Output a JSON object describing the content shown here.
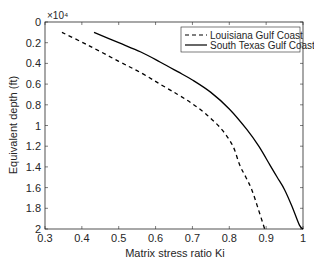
{
  "chart_data": {
    "type": "line",
    "title": "",
    "xlabel": "Matrix stress ratio Ki",
    "ylabel": "Equivalent depth (ft)",
    "y_multiplier_label": "×10⁴",
    "xlim": [
      0.3,
      1.0
    ],
    "ylim": [
      0,
      2
    ],
    "y_reversed": true,
    "grid": false,
    "legend_position": "upper right",
    "x_ticks": [
      0.3,
      0.4,
      0.5,
      0.6,
      0.7,
      0.8,
      0.9,
      1
    ],
    "x_tick_labels": [
      "0.3",
      "0.4",
      "0.5",
      "0.6",
      "0.7",
      "0.8",
      "0.9",
      "1"
    ],
    "y_ticks": [
      0,
      0.2,
      0.4,
      0.6,
      0.8,
      1,
      1.2,
      1.4,
      1.6,
      1.8,
      2
    ],
    "y_tick_labels": [
      "0",
      "0.2",
      "0.4",
      "0.6",
      "0.8",
      "1",
      "1.2",
      "1.4",
      "1.6",
      "1.8",
      "2"
    ],
    "series": [
      {
        "name": "Louisiana Gulf Coast",
        "style": "dashed",
        "color": "#000000",
        "x": [
          0.346,
          0.42,
          0.5,
          0.56,
          0.612,
          0.66,
          0.7,
          0.74,
          0.78,
          0.81,
          0.828,
          0.845,
          0.861,
          0.878,
          0.896
        ],
        "y": [
          0.1,
          0.23,
          0.38,
          0.49,
          0.6,
          0.7,
          0.79,
          0.9,
          1.04,
          1.2,
          1.38,
          1.5,
          1.62,
          1.8,
          2.0
        ]
      },
      {
        "name": "South Texas Gulf Coast",
        "style": "solid",
        "color": "#000000",
        "x": [
          0.433,
          0.5,
          0.56,
          0.612,
          0.66,
          0.7,
          0.75,
          0.8,
          0.848,
          0.88,
          0.91,
          0.93,
          0.95,
          0.97,
          0.99,
          1.0
        ],
        "y": [
          0.1,
          0.2,
          0.29,
          0.386,
          0.48,
          0.56,
          0.68,
          0.84,
          1.04,
          1.2,
          1.38,
          1.5,
          1.62,
          1.78,
          1.96,
          2.0
        ]
      }
    ]
  },
  "legend": {
    "items": [
      {
        "label": "Louisiana Gulf Coast",
        "style": "dashed"
      },
      {
        "label": "South Texas Gulf Coast",
        "style": "solid"
      }
    ]
  }
}
